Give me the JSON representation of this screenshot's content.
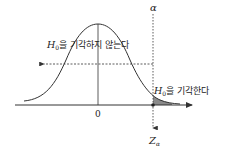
{
  "diagram": {
    "type": "normal-distribution-hypothesis-test",
    "labels": {
      "alpha": "α",
      "critical_value_main": "Z",
      "critical_value_sub": "α",
      "center_tick": "0",
      "do_not_reject_main": "H",
      "do_not_reject_sub": "0",
      "do_not_reject_text": "을 기각하지 않는다",
      "reject_main": "H",
      "reject_sub": "0",
      "reject_text": "을 기각한다"
    },
    "colors": {
      "line": "#333333",
      "shade": "#8a8a8a",
      "background": "#ffffff"
    }
  }
}
